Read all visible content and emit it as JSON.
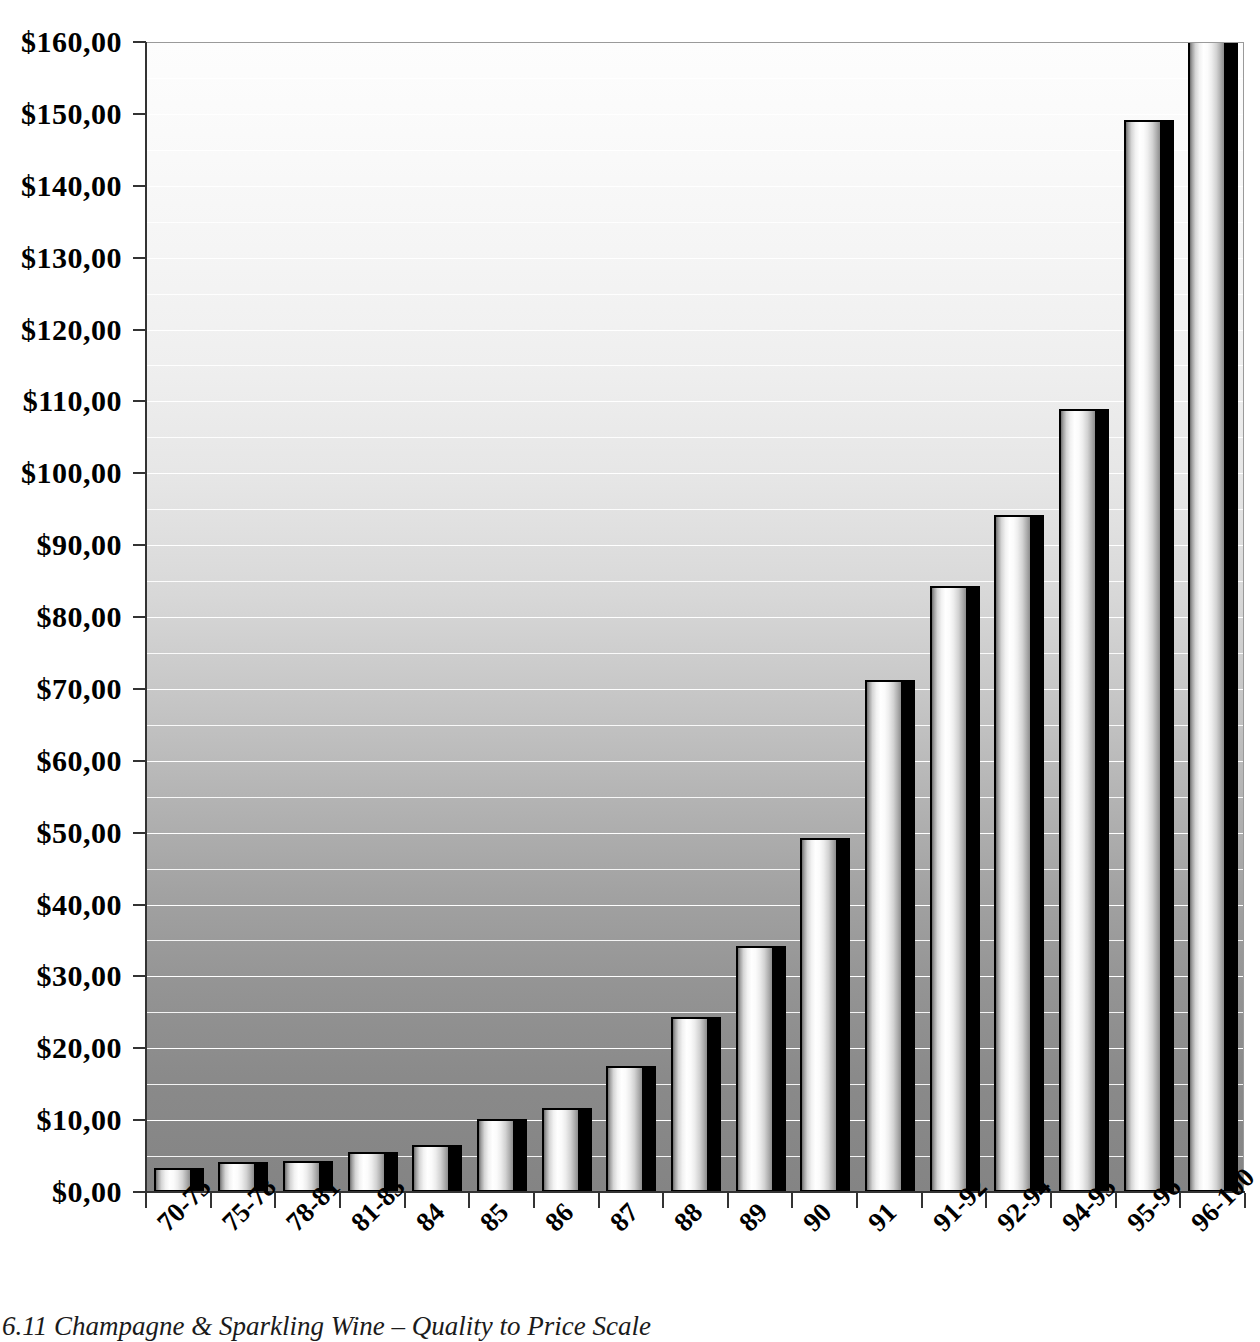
{
  "caption": "6.11  Champagne & Sparkling Wine – Quality to Price Scale",
  "axis": {
    "y_ticks": [
      "$0,00",
      "$10,00",
      "$20,00",
      "$30,00",
      "$40,00",
      "$50,00",
      "$60,00",
      "$70,00",
      "$80,00",
      "$90,00",
      "$100,00",
      "$110,00",
      "$120,00",
      "$130,00",
      "$140,00",
      "$150,00",
      "$160,00"
    ]
  },
  "chart_data": {
    "type": "bar",
    "title": "6.11  Champagne & Sparkling Wine – Quality to Price Scale",
    "xlabel": "",
    "ylabel": "",
    "ylim": [
      0,
      160
    ],
    "ytick_step": 10,
    "gridline_step": 5,
    "grid": true,
    "legend": "none",
    "currency": "USD",
    "decimal_separator": ",",
    "categories": [
      "70-75",
      "75-78",
      "78-81",
      "81-83",
      "84",
      "85",
      "86",
      "87",
      "88",
      "89",
      "90",
      "91",
      "91-92",
      "92-94",
      "94-95",
      "95-96",
      "96-100"
    ],
    "values": [
      3.3,
      4.2,
      4.3,
      5.5,
      6.5,
      10.2,
      11.7,
      17.6,
      24.4,
      34.2,
      49.2,
      71.3,
      84.3,
      94.2,
      109.0,
      149.1,
      175.0
    ],
    "value_labels": [
      "$3,30",
      "$4,20",
      "$4,30",
      "$5,50",
      "$6,50",
      "$10,20",
      "$11,70",
      "$17,60",
      "$24,40",
      "$34,20",
      "$49,20",
      "$71,30",
      "$84,30",
      "$94,20",
      "$109,00",
      "$149,10",
      "$175,00"
    ]
  }
}
